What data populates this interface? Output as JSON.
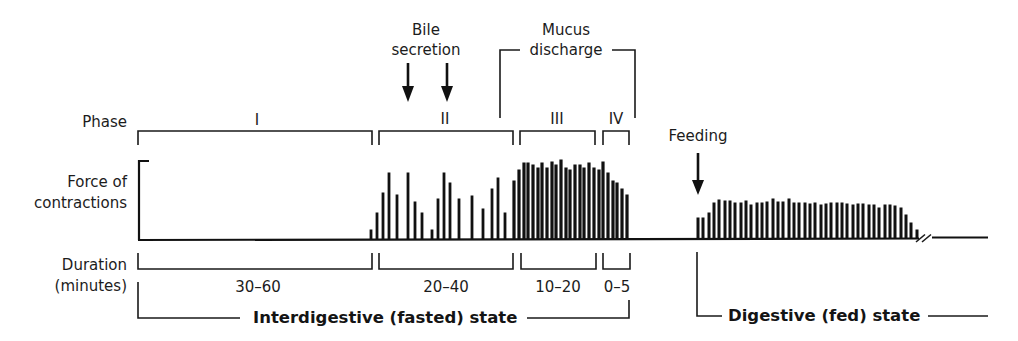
{
  "annotations": {
    "bile": {
      "line1": "Bile",
      "line2": "secretion"
    },
    "mucus": {
      "line1": "Mucus",
      "line2": "discharge"
    },
    "feeding": "Feeding"
  },
  "row_labels": {
    "phase": "Phase",
    "force_line1": "Force of",
    "force_line2": "contractions",
    "duration_line1": "Duration",
    "duration_line2": "(minutes)"
  },
  "phases": [
    {
      "label": "I",
      "duration": "30–60"
    },
    {
      "label": "II",
      "duration": "20–40"
    },
    {
      "label": "III",
      "duration": "10–20"
    },
    {
      "label": "IV",
      "duration": "0–5"
    }
  ],
  "states": {
    "fasted": "Interdigestive (fasted) state",
    "fed": "Digestive (fed) state"
  },
  "chart_data": {
    "type": "bar",
    "ylabel": "Force of contractions",
    "xlabel": "Duration (minutes)",
    "grid": false,
    "groups": [
      {
        "name": "Phase I",
        "x": [],
        "heights": []
      },
      {
        "name": "Phase II",
        "x": [
          371,
          377,
          383,
          389,
          397,
          408,
          415,
          422,
          432,
          438,
          444,
          450,
          459,
          472,
          483,
          492,
          498,
          505
        ],
        "heights": [
          10,
          27,
          47,
          67,
          45,
          67,
          38,
          27,
          10,
          41,
          67,
          57,
          41,
          44,
          31,
          51,
          62,
          27
        ]
      },
      {
        "name": "Phase III",
        "x": [
          514,
          519,
          524,
          528,
          533,
          538,
          542,
          547,
          552,
          556,
          561,
          566,
          570,
          575,
          580,
          584,
          589,
          594,
          599
        ],
        "heights": [
          59,
          70,
          77,
          77,
          75,
          72,
          77,
          72,
          78,
          75,
          80,
          72,
          70,
          75,
          75,
          72,
          77,
          72,
          70
        ]
      },
      {
        "name": "Phase IV",
        "x": [
          603,
          608,
          613,
          617,
          622,
          627
        ],
        "heights": [
          78,
          67,
          59,
          57,
          51,
          45
        ]
      },
      {
        "name": "Fed state",
        "x": [
          698,
          703,
          709,
          714,
          719,
          725,
          730,
          735,
          741,
          746,
          751,
          757,
          762,
          767,
          773,
          778,
          783,
          789,
          794,
          799,
          805,
          810,
          815,
          821,
          826,
          831,
          837,
          842,
          847,
          853,
          858,
          863,
          869,
          874,
          879,
          885,
          890,
          895,
          901,
          906,
          911,
          917
        ],
        "heights": [
          21,
          21,
          26,
          36,
          39,
          38,
          38,
          36,
          36,
          38,
          34,
          36,
          36,
          37,
          40,
          37,
          37,
          40,
          36,
          36,
          36,
          35,
          36,
          34,
          35,
          36,
          36,
          36,
          35,
          34,
          35,
          35,
          34,
          34,
          31,
          34,
          34,
          33,
          31,
          24,
          16,
          9
        ]
      }
    ]
  }
}
